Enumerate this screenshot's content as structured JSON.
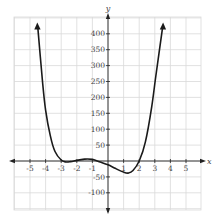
{
  "chart_data": {
    "type": "line",
    "title": "",
    "xlabel": "x",
    "ylabel": "y",
    "xlim": [
      -6,
      6
    ],
    "ylim": [
      -150,
      450
    ],
    "grid": true,
    "x_ticks": [
      -5,
      -4,
      -3,
      -2,
      -1,
      1,
      2,
      3,
      4,
      5
    ],
    "y_ticks": [
      400,
      350,
      300,
      250,
      200,
      150,
      100,
      50,
      -50,
      -100
    ],
    "x_tick_labels": [
      "-5",
      "-4",
      "-3",
      "-2",
      "-1",
      "1",
      "2",
      "3",
      "4",
      "5"
    ],
    "y_tick_labels": [
      "400",
      "350",
      "300",
      "250",
      "200",
      "150",
      "100",
      "50",
      "-50",
      "-100"
    ],
    "series": [
      {
        "name": "f(x)",
        "x": [
          -4.5,
          -4.2,
          -4.0,
          -3.7,
          -3.4,
          -3.0,
          -2.7,
          -2.4,
          -2.0,
          -1.5,
          -1.0,
          -0.5,
          0.0,
          0.5,
          1.0,
          1.3,
          1.6,
          2.0,
          2.4,
          2.8,
          3.1,
          3.5
        ],
        "y": [
          420,
          250,
          160,
          80,
          30,
          3,
          -3,
          -2,
          2,
          6,
          5,
          -3,
          -12,
          -24,
          -35,
          -38,
          -30,
          0,
          60,
          170,
          280,
          420
        ]
      }
    ],
    "annotations": [
      "arrow up at left end",
      "arrow up at right end"
    ],
    "approx_zeros": [
      -3,
      -0.5,
      2
    ],
    "approx_local_min": [
      {
        "x": -2.6,
        "y": -3
      },
      {
        "x": 1.3,
        "y": -38
      }
    ],
    "approx_local_max": [
      {
        "x": -1.2,
        "y": 6
      }
    ]
  },
  "axes": {
    "x_label": "x",
    "y_label": "y"
  },
  "colors": {
    "grid": "#d9d9d9",
    "axis": "#222222",
    "curve": "#1a1a1a",
    "text": "#444444"
  }
}
